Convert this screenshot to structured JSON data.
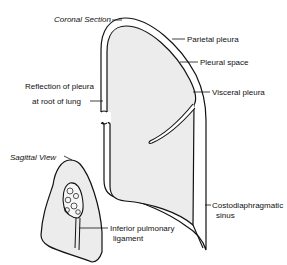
{
  "diagram": {
    "type": "anatomical-diagram",
    "views": {
      "coronal": {
        "title": "Coronal Section",
        "labels": {
          "parietal_pleura": "Parietal pleura",
          "pleural_space": "Pleural space",
          "visceral_pleura": "Visceral pleura",
          "reflection_line1": "Reflection of pleura",
          "reflection_line2": "at root of lung",
          "costo_line1": "Costodiaphragmatic",
          "costo_line2": "sinus"
        }
      },
      "sagittal": {
        "title": "Sagittal View",
        "labels": {
          "ligament_line1": "Inferior pulmonary",
          "ligament_line2": "ligament"
        }
      }
    },
    "colors": {
      "line": "#111111",
      "lung_fill": "#ececec",
      "background": "#ffffff"
    }
  }
}
